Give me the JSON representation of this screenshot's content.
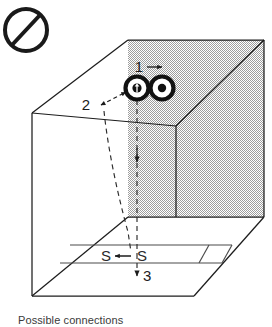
{
  "figure": {
    "title": "Possible connections",
    "type": "technical-line-drawing",
    "projection": "oblique-3d-box",
    "caption_clipped": true,
    "colors": {
      "line": "#1c1c1c",
      "shading_gray": "#b9b9b9",
      "background": "#ffffff",
      "dashed": "#2b2b2b"
    },
    "prohibition_icon": {
      "name": "no-entry-symbol",
      "shape": "circle-with-diagonal-slash"
    },
    "labels": {
      "route_1": "1",
      "route_2": "2",
      "route_3": "3",
      "slot_left": "S",
      "slot_right": "S"
    },
    "connectors": [
      {
        "name": "connector-left",
        "inner": "arrow-up"
      },
      {
        "name": "connector-right",
        "inner": "dot"
      }
    ],
    "arrows": [
      {
        "name": "arrow-route-1",
        "direction": "right"
      },
      {
        "name": "arrow-route-2",
        "direction": "bidirectional-diagonal"
      },
      {
        "name": "arrow-route-3",
        "direction": "down"
      },
      {
        "name": "arrow-slot",
        "direction": "left"
      },
      {
        "name": "arrow-vertical-drop",
        "direction": "down"
      }
    ]
  }
}
